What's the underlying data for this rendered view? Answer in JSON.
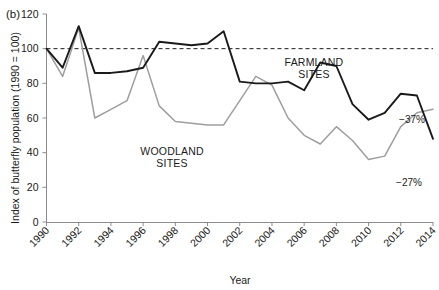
{
  "chart_data": {
    "type": "line",
    "title": "",
    "panel_label": "(b)",
    "xlabel": "Year",
    "ylabel": "Index of butterfly population (1990 = 100)",
    "xlim": [
      1990,
      2014
    ],
    "ylim": [
      0,
      120
    ],
    "yticks": [
      0,
      20,
      40,
      60,
      80,
      100,
      120
    ],
    "xticks": [
      1990,
      1992,
      1994,
      1996,
      1998,
      2000,
      2002,
      2004,
      2006,
      2008,
      2010,
      2012,
      2014
    ],
    "grid": false,
    "legend": "inline-labels",
    "reference_line": {
      "value": 100,
      "style": "dashed",
      "label": ""
    },
    "x": [
      1990,
      1991,
      1992,
      1993,
      1994,
      1995,
      1996,
      1997,
      1998,
      1999,
      2000,
      2001,
      2002,
      2003,
      2004,
      2005,
      2006,
      2007,
      2008,
      2009,
      2010,
      2011,
      2012,
      2013,
      2014
    ],
    "series": [
      {
        "name": "FARMLAND SITES",
        "color": "#1a1a1a",
        "end_annotation": "−27%",
        "values": [
          100,
          89,
          113,
          86,
          86,
          87,
          89,
          104,
          103,
          102,
          103,
          110,
          81,
          80,
          80,
          81,
          76,
          92,
          90,
          68,
          59,
          63,
          74,
          73,
          48
        ]
      },
      {
        "name": "WOODLAND SITES",
        "color": "#9e9e9e",
        "end_annotation": "−37%",
        "values": [
          100,
          84,
          112,
          60,
          65,
          70,
          96,
          67,
          58,
          57,
          56,
          56,
          70,
          84,
          79,
          60,
          50,
          45,
          55,
          47,
          36,
          38,
          55,
          63,
          65
        ]
      }
    ],
    "annotations": [
      {
        "name": "farmland-label",
        "text": "FARMLAND",
        "x": 314,
        "y": 66
      },
      {
        "name": "farmland-label-2",
        "text": "SITES",
        "x": 314,
        "y": 78
      },
      {
        "name": "woodland-label",
        "text": "WOODLAND",
        "x": 172,
        "y": 155
      },
      {
        "name": "woodland-label-2",
        "text": "SITES",
        "x": 172,
        "y": 167
      },
      {
        "name": "woodland-pct",
        "text": "−37%",
        "x": 412,
        "y": 123
      },
      {
        "name": "farmland-pct",
        "text": "−27%",
        "x": 409,
        "y": 186
      }
    ]
  }
}
